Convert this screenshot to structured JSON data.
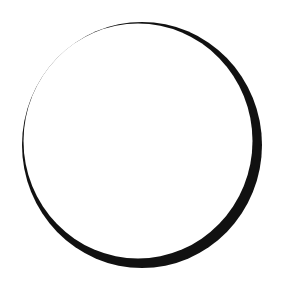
{
  "figure": {
    "background_color": "#ffffff",
    "stroke_color": "#111111",
    "outer_shape": {
      "cx": 142,
      "cy": 145,
      "rx": 120,
      "ry": 123
    },
    "inner_shape": {
      "cx": 138,
      "cy": 141,
      "rx": 114.5,
      "ry": 117.5
    }
  }
}
